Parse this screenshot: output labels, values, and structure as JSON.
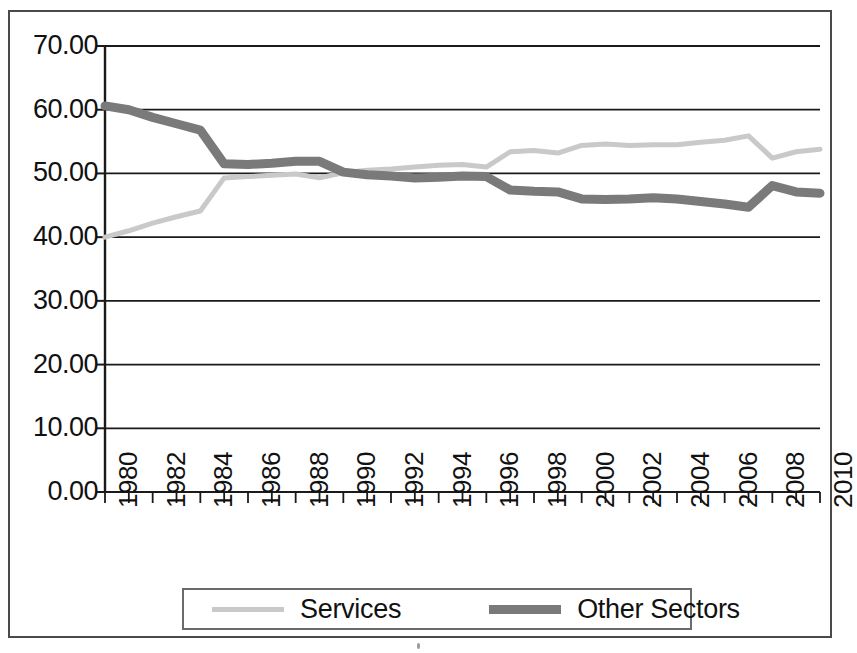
{
  "chart_data": {
    "type": "line",
    "title": "",
    "xlabel": "",
    "ylabel": "",
    "x": [
      1980,
      1981,
      1982,
      1983,
      1984,
      1985,
      1986,
      1987,
      1988,
      1989,
      1990,
      1991,
      1992,
      1993,
      1994,
      1995,
      1996,
      1997,
      1998,
      1999,
      2000,
      2001,
      2002,
      2003,
      2004,
      2005,
      2006,
      2007,
      2008,
      2009,
      2010
    ],
    "xlim": [
      1980,
      2010
    ],
    "ylim": [
      0.0,
      70.0
    ],
    "yticks": [
      "0.00",
      "10.00",
      "20.00",
      "30.00",
      "40.00",
      "50.00",
      "60.00",
      "70.00"
    ],
    "ytick_values": [
      0,
      10,
      20,
      30,
      40,
      50,
      60,
      70
    ],
    "xticks": [
      "1980",
      "1982",
      "1984",
      "1986",
      "1988",
      "1990",
      "1992",
      "1994",
      "1996",
      "1998",
      "2000",
      "2002",
      "2004",
      "2006",
      "2008",
      "2010"
    ],
    "xtick_values": [
      1980,
      1982,
      1984,
      1986,
      1988,
      1990,
      1992,
      1994,
      1996,
      1998,
      2000,
      2002,
      2004,
      2006,
      2008,
      2010
    ],
    "grid": true,
    "grid_axis": "y",
    "legend_position": "bottom",
    "series": [
      {
        "name": "Services",
        "color": "#c9c9c9",
        "width": 5,
        "values": [
          40.0,
          41.0,
          42.2,
          43.2,
          44.1,
          49.3,
          49.5,
          49.7,
          49.9,
          49.3,
          50.1,
          50.5,
          50.7,
          51.0,
          51.3,
          51.4,
          51.0,
          53.4,
          53.6,
          53.2,
          54.4,
          54.6,
          54.4,
          54.5,
          54.5,
          54.9,
          55.2,
          55.9,
          52.4,
          53.4,
          53.8
        ]
      },
      {
        "name": "Other Sectors",
        "color": "#7a7a7a",
        "width": 9,
        "values": [
          60.6,
          60.0,
          58.8,
          57.8,
          56.8,
          51.5,
          51.4,
          51.6,
          51.9,
          51.9,
          50.2,
          49.8,
          49.6,
          49.3,
          49.4,
          49.6,
          49.5,
          47.4,
          47.2,
          47.1,
          46.0,
          45.9,
          46.0,
          46.2,
          46.0,
          45.6,
          45.2,
          44.7,
          48.1,
          47.1,
          46.9
        ]
      }
    ]
  },
  "legend": {
    "entries": [
      {
        "label": "Services",
        "swatch": "light-line-swatch"
      },
      {
        "label": "Other Sectors",
        "swatch": "dark-line-swatch"
      }
    ]
  },
  "colors": {
    "services": "#c9c9c9",
    "other_sectors": "#7a7a7a",
    "axis": "#1a1a1a",
    "grid": "#1a1a1a",
    "frame": "#4a4a4a"
  }
}
